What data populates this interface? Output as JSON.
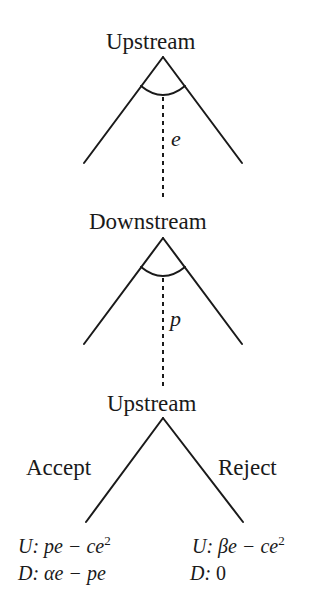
{
  "diagram": {
    "type": "game-tree",
    "nodes": [
      {
        "id": "n1",
        "label": "Upstream",
        "decision": "e",
        "continuous": true
      },
      {
        "id": "n2",
        "label": "Downstream",
        "decision": "p",
        "continuous": true
      },
      {
        "id": "n3",
        "label": "Upstream",
        "branches": [
          "Accept",
          "Reject"
        ]
      }
    ],
    "branches": {
      "accept": "Accept",
      "reject": "Reject"
    },
    "payoffs": {
      "accept": {
        "u_prefix": "U:",
        "u": "pe − ce",
        "u_exp": "2",
        "d_prefix": "D:",
        "d": "αe − pe"
      },
      "reject": {
        "u_prefix": "U:",
        "u": "βe − ce",
        "u_exp": "2",
        "d_prefix": "D:",
        "d": "0"
      }
    },
    "edges": [
      {
        "from": "n1",
        "to": "n2",
        "label": "e",
        "style": "dashed"
      },
      {
        "from": "n2",
        "to": "n3",
        "label": "p",
        "style": "dashed"
      }
    ]
  }
}
